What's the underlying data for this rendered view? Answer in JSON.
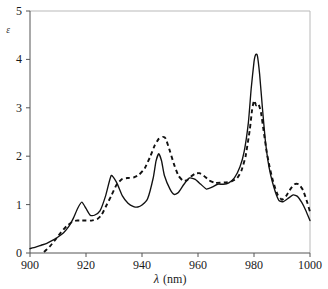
{
  "chart_data": {
    "type": "line",
    "title": "",
    "subtitle": "",
    "xlabel": "λ (nm)",
    "xlabel_symbol": "λ",
    "xlabel_unit": "(nm)",
    "ylabel": "ε",
    "xlim": [
      900,
      1000
    ],
    "ylim": [
      0,
      5
    ],
    "xticks": [
      900,
      920,
      940,
      960,
      980,
      1000
    ],
    "yticks": [
      0,
      1,
      2,
      3,
      4,
      5
    ],
    "xtick_labels": [
      "900",
      "920",
      "940",
      "960",
      "980",
      "1000"
    ],
    "ytick_labels": [
      "0",
      "1",
      "2",
      "3",
      "4",
      "5"
    ],
    "grid": false,
    "legend": "none",
    "line_color": "#111111",
    "background": "#ffffff",
    "series": [
      {
        "name": "solid-spectrum",
        "style": "solid",
        "x": [
          900,
          902,
          904,
          906,
          908,
          910,
          912,
          914,
          915.5,
          917,
          918.5,
          920,
          921.5,
          923,
          925,
          927,
          929,
          931,
          933,
          935,
          937,
          938.5,
          940,
          942,
          944,
          945,
          946,
          947,
          948,
          950,
          951.5,
          953,
          955,
          957,
          959,
          961,
          963,
          965,
          967,
          969,
          971,
          973,
          975,
          976.5,
          978,
          979,
          980,
          980.6,
          981.2,
          982,
          983,
          984,
          985,
          986,
          987,
          988,
          989,
          990.5,
          992,
          994,
          995.5,
          997,
          998.5,
          1000
        ],
        "y": [
          0.09,
          0.12,
          0.16,
          0.2,
          0.26,
          0.33,
          0.42,
          0.56,
          0.72,
          0.92,
          1.05,
          0.92,
          0.78,
          0.78,
          0.87,
          1.18,
          1.6,
          1.45,
          1.18,
          1.03,
          0.96,
          0.95,
          0.99,
          1.12,
          1.55,
          1.9,
          2.05,
          1.9,
          1.6,
          1.32,
          1.21,
          1.25,
          1.42,
          1.55,
          1.52,
          1.42,
          1.32,
          1.36,
          1.42,
          1.42,
          1.45,
          1.55,
          1.78,
          2.1,
          2.7,
          3.4,
          3.95,
          4.1,
          4.08,
          3.7,
          3.0,
          2.35,
          1.9,
          1.6,
          1.38,
          1.2,
          1.08,
          1.06,
          1.12,
          1.2,
          1.17,
          1.05,
          0.88,
          0.67
        ]
      },
      {
        "name": "dashed-spectrum",
        "style": "dashed",
        "x": [
          905,
          907,
          909,
          911,
          913,
          915,
          916.5,
          918,
          920,
          922,
          924,
          925.5,
          927,
          929,
          931,
          933,
          935,
          937,
          939,
          941,
          943,
          944.5,
          946,
          947.5,
          948.5,
          950,
          951.5,
          953,
          954.5,
          956,
          957.5,
          959,
          960.5,
          962,
          964,
          966,
          968,
          970,
          972,
          974,
          975.5,
          977,
          978.5,
          979.3,
          980,
          980.8,
          981.6,
          982.5,
          983.5,
          984.5,
          985.5,
          986.5,
          987.5,
          988.5,
          990,
          991.5,
          993,
          994.5,
          996,
          997.5,
          999,
          1000
        ],
        "y": [
          0.02,
          0.13,
          0.27,
          0.42,
          0.55,
          0.64,
          0.67,
          0.67,
          0.67,
          0.67,
          0.7,
          0.78,
          0.95,
          1.18,
          1.42,
          1.53,
          1.55,
          1.56,
          1.62,
          1.75,
          2.0,
          2.22,
          2.36,
          2.4,
          2.36,
          2.1,
          1.82,
          1.6,
          1.5,
          1.5,
          1.58,
          1.64,
          1.65,
          1.6,
          1.5,
          1.45,
          1.45,
          1.46,
          1.48,
          1.55,
          1.7,
          2.0,
          2.55,
          2.95,
          3.15,
          3.05,
          3.08,
          2.9,
          2.5,
          2.1,
          1.8,
          1.55,
          1.35,
          1.2,
          1.1,
          1.18,
          1.32,
          1.42,
          1.42,
          1.3,
          1.05,
          0.85
        ]
      }
    ]
  },
  "figure": {
    "plot_left_px": 30,
    "plot_right_px": 310,
    "plot_top_px": 11,
    "plot_bottom_px": 253
  }
}
